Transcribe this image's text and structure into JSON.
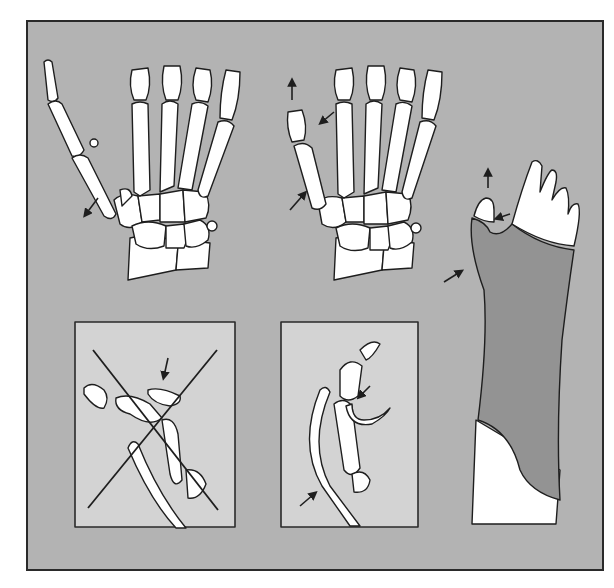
{
  "figure": {
    "description": "Thumb metacarpal base fracture (Bennett type) and treatment with thumb spica cast",
    "colors": {
      "background": "#b3b3b3",
      "inset_background": "#d3d3d3",
      "bone_fill": "#ffffff",
      "outline": "#1e1e1e",
      "cast": "#939393",
      "frame_border": "#2a2a2a"
    },
    "panels": [
      {
        "id": "fracture-displaced",
        "label": "Fracture at base of first metacarpal, displaced (skeletal AP view)"
      },
      {
        "id": "fracture-reduced",
        "label": "Traction reduction of thumb (skeletal AP view)"
      },
      {
        "id": "thumb-spica-cast",
        "label": "Thumb spica cast with pressure point at metacarpal base"
      },
      {
        "id": "incorrect-lateral",
        "label": "Incorrect lateral cast position (crossed out)"
      },
      {
        "id": "correct-lateral",
        "label": "Correct lateral cast position with molding"
      }
    ],
    "arrows": [
      {
        "panel": "fracture-displaced",
        "direction": "down-left"
      },
      {
        "panel": "fracture-reduced",
        "direction": "up"
      },
      {
        "panel": "fracture-reduced",
        "direction": "down-left"
      },
      {
        "panel": "fracture-reduced",
        "direction": "up-right"
      },
      {
        "panel": "thumb-spica-cast",
        "direction": "up"
      },
      {
        "panel": "thumb-spica-cast",
        "direction": "left"
      },
      {
        "panel": "thumb-spica-cast",
        "direction": "up-right"
      },
      {
        "panel": "incorrect-lateral",
        "direction": "down"
      },
      {
        "panel": "correct-lateral",
        "direction": "down-left"
      },
      {
        "panel": "correct-lateral",
        "direction": "up-right"
      }
    ],
    "marks": {
      "incorrect-lateral": "cross-out-x"
    }
  }
}
